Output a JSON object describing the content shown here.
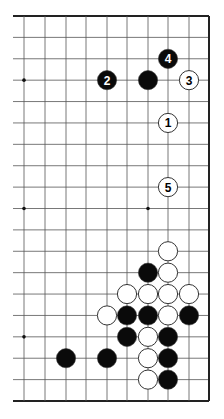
{
  "diagram": {
    "type": "go-board-fragment",
    "board": {
      "columns_x": [
        24,
        45,
        66,
        86,
        107,
        127,
        148,
        168,
        189,
        209
      ],
      "row_count": 19,
      "top_y": 16,
      "bottom_y": 401,
      "left_line_start_x": 13,
      "right_edge_col": 9,
      "top_edge": true,
      "bottom_edge": true,
      "right_edge": true,
      "left_edge": false
    },
    "star_points": [
      {
        "col": 0,
        "row": 3
      },
      {
        "col": 0,
        "row": 9
      },
      {
        "col": 6,
        "row": 9
      },
      {
        "col": 0,
        "row": 15
      }
    ],
    "stones": [
      {
        "color": "black",
        "col": 4,
        "row": 3,
        "label": "2"
      },
      {
        "color": "black",
        "col": 6,
        "row": 3,
        "label": ""
      },
      {
        "color": "black",
        "col": 7,
        "row": 2,
        "label": "4"
      },
      {
        "color": "white",
        "col": 8,
        "row": 3,
        "label": "3"
      },
      {
        "color": "white",
        "col": 7,
        "row": 5,
        "label": "1"
      },
      {
        "color": "white",
        "col": 7,
        "row": 8,
        "label": "5"
      },
      {
        "color": "white",
        "col": 7,
        "row": 11,
        "label": ""
      },
      {
        "color": "black",
        "col": 6,
        "row": 12,
        "label": ""
      },
      {
        "color": "white",
        "col": 7,
        "row": 12,
        "label": ""
      },
      {
        "color": "white",
        "col": 5,
        "row": 13,
        "label": ""
      },
      {
        "color": "white",
        "col": 6,
        "row": 13,
        "label": ""
      },
      {
        "color": "white",
        "col": 7,
        "row": 13,
        "label": ""
      },
      {
        "color": "white",
        "col": 8,
        "row": 13,
        "label": ""
      },
      {
        "color": "white",
        "col": 4,
        "row": 14,
        "label": ""
      },
      {
        "color": "black",
        "col": 5,
        "row": 14,
        "label": ""
      },
      {
        "color": "black",
        "col": 6,
        "row": 14,
        "label": ""
      },
      {
        "color": "white",
        "col": 7,
        "row": 14,
        "label": ""
      },
      {
        "color": "black",
        "col": 8,
        "row": 14,
        "label": ""
      },
      {
        "color": "black",
        "col": 5,
        "row": 15,
        "label": ""
      },
      {
        "color": "white",
        "col": 6,
        "row": 15,
        "label": ""
      },
      {
        "color": "black",
        "col": 7,
        "row": 15,
        "label": ""
      },
      {
        "color": "black",
        "col": 2,
        "row": 16,
        "label": ""
      },
      {
        "color": "black",
        "col": 4,
        "row": 16,
        "label": ""
      },
      {
        "color": "white",
        "col": 6,
        "row": 16,
        "label": ""
      },
      {
        "color": "black",
        "col": 7,
        "row": 16,
        "label": ""
      },
      {
        "color": "white",
        "col": 6,
        "row": 17,
        "label": ""
      },
      {
        "color": "black",
        "col": 7,
        "row": 17,
        "label": ""
      }
    ],
    "colors": {
      "line": "#555555",
      "edge": "#222222",
      "black_stone": "#0a0a0a",
      "white_stone": "#ffffff",
      "stone_outline": "#333333"
    }
  }
}
